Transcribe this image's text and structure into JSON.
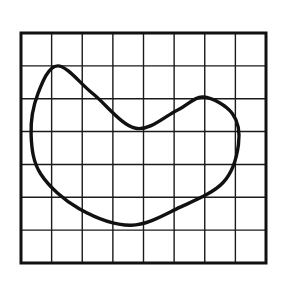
{
  "figure": {
    "kind": "closed-curve-on-grid",
    "background_color": "#ffffff",
    "caption": "",
    "title": ""
  },
  "chart_data": {
    "type": "line",
    "title": "",
    "xlabel": "",
    "ylabel": "",
    "grid": true,
    "legend_position": "none",
    "axis_ticks_visible": false,
    "tick_labels_x": [],
    "tick_labels_y": [],
    "xlim": [
      0,
      8
    ],
    "ylim": [
      0,
      7
    ],
    "grid_columns": 8,
    "grid_rows": 7,
    "grid_cell_width_px": 30.6,
    "grid_cell_height_px": 32.9,
    "grid_color": "#1a1a1a",
    "grid_line_width_px": 1.4,
    "border_color": "#111111",
    "border_width_px": 3,
    "plot_area_px": {
      "left": 21,
      "top": 33,
      "width": 245,
      "height": 230
    },
    "series": [
      {
        "name": "bean-curve",
        "closed": true,
        "fill": "none",
        "stroke_color": "#111111",
        "stroke_width_px": 3.4,
        "annotations": [
          {
            "label": "left-peak",
            "x": 1.2,
            "y": 1.0
          },
          {
            "label": "valley",
            "x": 3.75,
            "y": 2.9
          },
          {
            "label": "right-bump",
            "x": 5.95,
            "y": 1.95
          },
          {
            "label": "rightmost",
            "x": 7.1,
            "y": 3.0
          },
          {
            "label": "bottom",
            "x": 3.6,
            "y": 5.85
          },
          {
            "label": "leftmost",
            "x": 0.33,
            "y": 3.1
          }
        ],
        "path_points_grid": [
          {
            "x": 1.2,
            "y": 1.0
          },
          {
            "x": 2.35,
            "y": 1.85
          },
          {
            "x": 3.75,
            "y": 2.9
          },
          {
            "x": 5.1,
            "y": 2.35
          },
          {
            "x": 5.95,
            "y": 1.95
          },
          {
            "x": 6.9,
            "y": 2.45
          },
          {
            "x": 7.1,
            "y": 3.4
          },
          {
            "x": 6.6,
            "y": 4.55
          },
          {
            "x": 5.2,
            "y": 5.3
          },
          {
            "x": 3.6,
            "y": 5.85
          },
          {
            "x": 1.9,
            "y": 5.35
          },
          {
            "x": 0.65,
            "y": 4.3
          },
          {
            "x": 0.33,
            "y": 3.1
          },
          {
            "x": 0.55,
            "y": 1.85
          },
          {
            "x": 1.2,
            "y": 1.0
          }
        ]
      }
    ]
  }
}
